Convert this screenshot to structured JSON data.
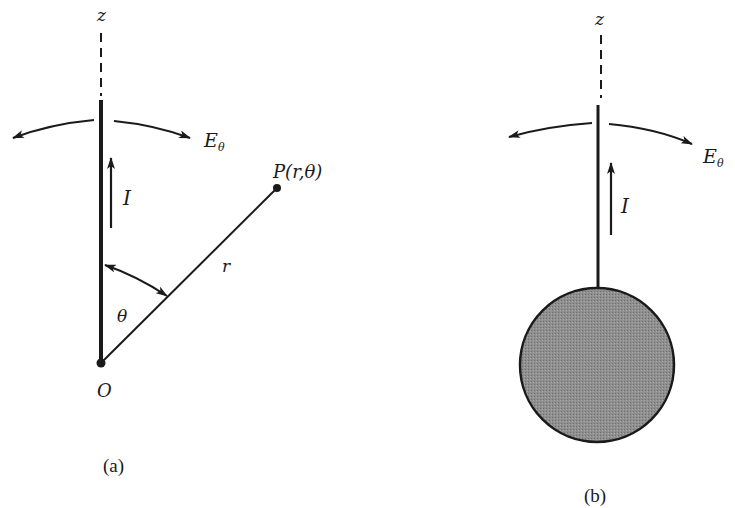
{
  "figure": {
    "panel_a": {
      "caption": "(a)",
      "axis_label": "z",
      "field_label_main": "E",
      "field_label_sub": "θ",
      "current_label": "I",
      "point_label": "P(r,θ)",
      "radius_label": "r",
      "angle_label": "θ",
      "origin_label": "O"
    },
    "panel_b": {
      "caption": "(b)",
      "axis_label": "z",
      "field_label_main": "E",
      "field_label_sub": "θ",
      "current_label": "I"
    },
    "colors": {
      "ink": "#1a1a1a",
      "sphere_fill": "#8c8c8c",
      "background": "#ffffff"
    }
  }
}
